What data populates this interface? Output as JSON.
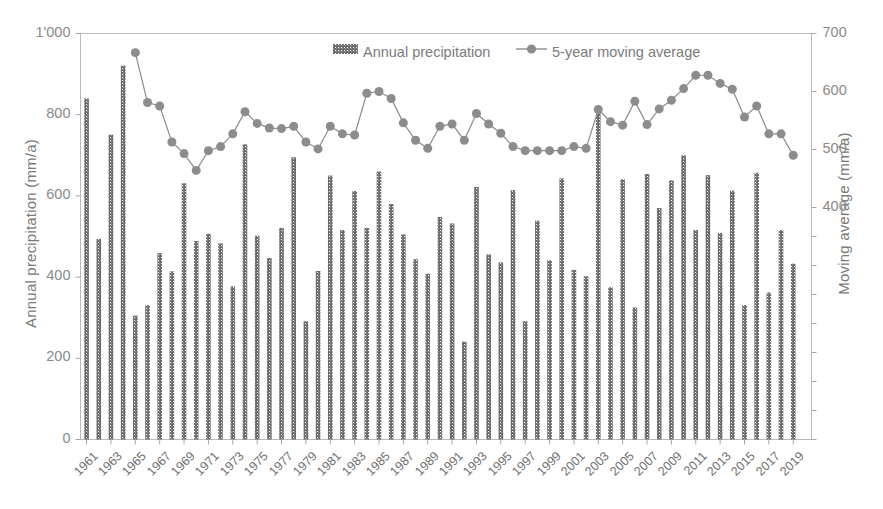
{
  "chart_data": {
    "type": "bar",
    "title": "",
    "subtitle": "",
    "xlabel": "",
    "ylabel": "Annual precipitation (mm/a)",
    "y2label": "Moving average (mm/a)",
    "grid": false,
    "legend_position": "top-center",
    "ylim": [
      0,
      1000
    ],
    "ylim_right": [
      0,
      700
    ],
    "ytick_labels": [
      "0",
      "200",
      "400",
      "600",
      "800",
      "1'000"
    ],
    "ytick_values": [
      0,
      200,
      400,
      600,
      800,
      1000
    ],
    "ytick_right_labels": [
      "400",
      "500",
      "600",
      "700"
    ],
    "ytick_right_values": [
      400,
      500,
      600,
      700
    ],
    "ytick_right_minor_values": [
      0,
      50,
      100,
      150,
      200,
      250,
      300,
      350
    ],
    "xtick_labels": [
      "1961",
      "1963",
      "1965",
      "1967",
      "1969",
      "1971",
      "1973",
      "1975",
      "1977",
      "1979",
      "1981",
      "1983",
      "1985",
      "1987",
      "1989",
      "1991",
      "1993",
      "1995",
      "1997",
      "1999",
      "2001",
      "2003",
      "2005",
      "2007",
      "2009",
      "2011",
      "2013",
      "2015",
      "2017",
      "2019"
    ],
    "categories": [
      1961,
      1962,
      1963,
      1964,
      1965,
      1966,
      1967,
      1968,
      1969,
      1970,
      1971,
      1972,
      1973,
      1974,
      1975,
      1976,
      1977,
      1978,
      1979,
      1980,
      1981,
      1982,
      1983,
      1984,
      1985,
      1986,
      1987,
      1988,
      1989,
      1990,
      1991,
      1992,
      1993,
      1994,
      1995,
      1996,
      1997,
      1998,
      1999,
      2000,
      2001,
      2002,
      2003,
      2004,
      2005,
      2006,
      2007,
      2008,
      2009,
      2010,
      2011,
      2012,
      2013,
      2014,
      2015,
      2016,
      2017,
      2018,
      2019,
      2020
    ],
    "series": [
      {
        "name": "Annual precipitation",
        "type": "bar",
        "axis": "left",
        "unit": "mm/a",
        "color": "#6b6b6b",
        "values": [
          840,
          494,
          751,
          921,
          305,
          331,
          459,
          414,
          631,
          489,
          507,
          483,
          377,
          727,
          502,
          447,
          521,
          695,
          291,
          415,
          650,
          516,
          612,
          521,
          660,
          580,
          505,
          444,
          408,
          548,
          532,
          241,
          622,
          456,
          436,
          614,
          291,
          539,
          441,
          643,
          418,
          402,
          814,
          375,
          641,
          325,
          654,
          570,
          638,
          700,
          516,
          651,
          509,
          613,
          331,
          657,
          362,
          516,
          433,
          null
        ]
      },
      {
        "name": "5-year moving average",
        "type": "line",
        "axis": "right",
        "unit": "mm/a",
        "color": "#8c8c8c",
        "marker": "circle",
        "values": [
          null,
          null,
          null,
          null,
          667,
          581,
          575,
          513,
          493,
          464,
          498,
          505,
          527,
          565,
          545,
          537,
          536,
          540,
          513,
          501,
          540,
          527,
          525,
          597,
          600,
          588,
          546,
          516,
          502,
          540,
          544,
          516,
          562,
          544,
          528,
          505,
          498,
          498,
          498,
          498,
          505,
          502,
          569,
          548,
          542,
          583,
          543,
          570,
          585,
          605,
          628,
          628,
          614,
          604,
          556,
          575,
          527,
          527,
          490,
          null
        ]
      }
    ],
    "legend": [
      {
        "label": "Annual precipitation",
        "marker": "bar-swatch",
        "color": "#6b6b6b"
      },
      {
        "label": "5-year moving average",
        "marker": "line-circle",
        "color": "#8c8c8c"
      }
    ]
  },
  "colors": {
    "bar": "#6b6b6b",
    "line": "#8c8c8c",
    "marker": "#8c8c8c",
    "axis": "#a0a0a0",
    "text": "#7a7a7a",
    "background": "#ffffff"
  }
}
